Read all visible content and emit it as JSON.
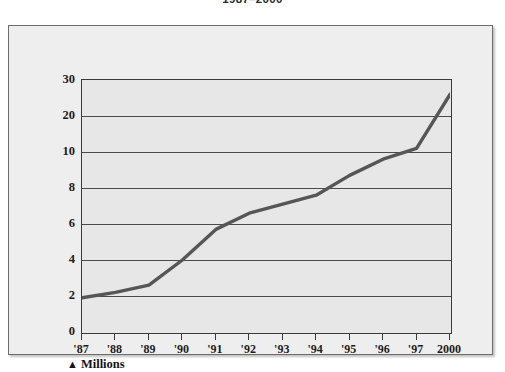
{
  "title": "1987–2000",
  "axis_note": {
    "marker": "▲",
    "label": "Millions"
  },
  "colors": {
    "frame_background": "#eeeeee",
    "plot_background": "#e7e7e7",
    "frame_border": "#6d6d6d",
    "axis": "#3a3a3a",
    "gridline": "#4a4a4a",
    "line_series": "#565656",
    "text": "#1c1c1c"
  },
  "chart_data": {
    "type": "line",
    "title": "1987–2000",
    "xlabel": "",
    "ylabel": "Millions",
    "grid": true,
    "legend": false,
    "legend_position": "none",
    "scale_note": "Y axis is non-linear: even spacing between 0,2,4,6,8,10,20,30",
    "categories": [
      "'87",
      "'88",
      "'89",
      "'90",
      "'91",
      "'92",
      "'93",
      "'94",
      "'95",
      "'96",
      "'97",
      "2000"
    ],
    "x_tick_labels": [
      "'87",
      "'88",
      "'89",
      "'90",
      "'91",
      "'92",
      "'93",
      "'94",
      "'95",
      "'96",
      "'97",
      "2000"
    ],
    "y_tick_labels": [
      "0",
      "2",
      "4",
      "6",
      "8",
      "10",
      "20",
      "30"
    ],
    "y_tick_values": [
      0,
      2,
      4,
      6,
      8,
      10,
      20,
      30
    ],
    "ylim": [
      0,
      30
    ],
    "values": [
      1.9,
      2.2,
      2.6,
      4.0,
      5.7,
      6.6,
      7.1,
      7.6,
      8.7,
      9.6,
      11.0,
      26.0
    ],
    "series": [
      {
        "name": "Millions",
        "values": [
          1.9,
          2.2,
          2.6,
          4.0,
          5.7,
          6.6,
          7.1,
          7.6,
          8.7,
          9.6,
          11.0,
          26.0
        ]
      }
    ]
  }
}
